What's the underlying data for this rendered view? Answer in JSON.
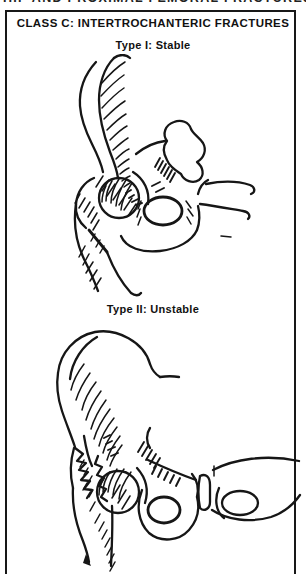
{
  "page": {
    "running_header": "HIP AND PROXIMAL FEMORAL FRACTURES",
    "plate_title": "CLASS C: INTERTROCHANTERIC FRACTURES",
    "figures": [
      {
        "caption": "Type I: Stable",
        "description": "line drawing of hip with single clean intertrochanteric fracture line"
      },
      {
        "caption": "Type II: Unstable",
        "description": "line drawing of hip with comminuted multi-fragment intertrochanteric fracture"
      }
    ],
    "colors": {
      "ink": "#161616",
      "paper": "#ffffff"
    }
  }
}
